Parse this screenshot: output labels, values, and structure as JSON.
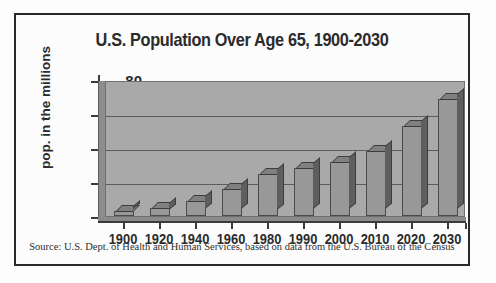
{
  "chart_data": {
    "type": "bar",
    "title": "U.S. Population Over Age 65, 1900-2030",
    "xlabel": "",
    "ylabel": "pop. in the millions",
    "categories": [
      "1900",
      "1920",
      "1940",
      "1960",
      "1980",
      "1990",
      "2000",
      "2010",
      "2020",
      "2030"
    ],
    "values": [
      3,
      5,
      9,
      16,
      25,
      28,
      32,
      38,
      53,
      69
    ],
    "ylim": [
      0,
      80
    ],
    "yticks": [
      "0",
      "20",
      "40",
      "60",
      "80"
    ],
    "ytick_values": [
      0,
      20,
      40,
      60,
      80
    ],
    "grid": true,
    "legend": "none",
    "style": "3d-bar",
    "colors": {
      "bar_face": "#989898",
      "bar_side": "#5e5e5e",
      "bar_top": "#808080",
      "plot_background": "#a9a9a9",
      "gridline": "#5c5c5c",
      "axis": "#3a3a3a",
      "text": "#2b2b2b",
      "frame": "#2a2a2a",
      "page_background": "#ffffff"
    }
  },
  "figure": {
    "title": "U.S. Population Over Age 65, 1900-2030",
    "y_axis_title": "pop. in the millions",
    "source_note": "Source:  U.S. Dept. of Health and Human Services, based on data from the U.S. Bureau of the Census"
  }
}
